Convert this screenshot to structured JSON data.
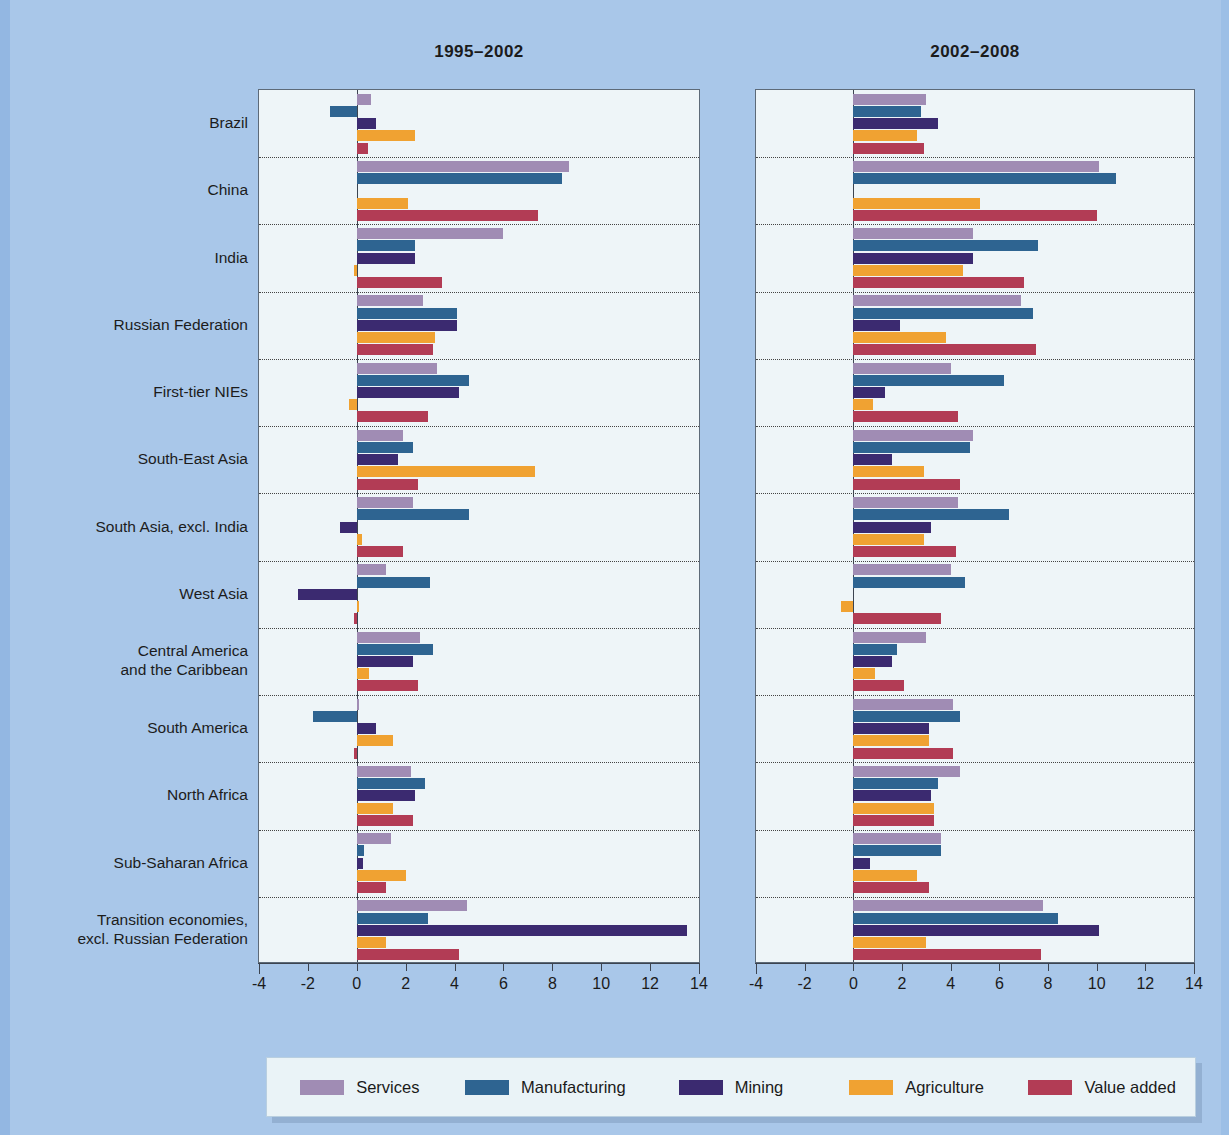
{
  "panels": [
    {
      "title": "1995–2002"
    },
    {
      "title": "2002–2008"
    }
  ],
  "axis": {
    "ticks": [
      "-4",
      "-2",
      "0",
      "2",
      "4",
      "6",
      "8",
      "10",
      "12",
      "14"
    ],
    "min": -4,
    "max": 14
  },
  "legend": [
    {
      "label": "Services",
      "color": "#a08cb4"
    },
    {
      "label": "Manufacturing",
      "color": "#2e6491"
    },
    {
      "label": "Mining",
      "color": "#3b2a70"
    },
    {
      "label": "Agriculture",
      "color": "#f0a232"
    },
    {
      "label": "Value added",
      "color": "#b23c55"
    }
  ],
  "categories": [
    "Brazil",
    "China",
    "India",
    "Russian Federation",
    "First-tier NIEs",
    "South-East Asia",
    "South Asia, excl. India",
    "West Asia",
    "Central America\nand the Caribbean",
    "South America",
    "North Africa",
    "Sub-Saharan Africa",
    "Transition economies,\nexcl. Russian Federation"
  ],
  "chart_data": [
    {
      "type": "bar",
      "title": "1995–2002",
      "orientation": "horizontal",
      "xlabel": "",
      "ylabel": "",
      "xlim": [
        -4,
        14
      ],
      "grid": false,
      "legend_position": "bottom",
      "categories": [
        "Brazil",
        "China",
        "India",
        "Russian Federation",
        "First-tier NIEs",
        "South-East Asia",
        "South Asia, excl. India",
        "West Asia",
        "Central America and the Caribbean",
        "South America",
        "North Africa",
        "Sub-Saharan Africa",
        "Transition economies, excl. Russian Federation"
      ],
      "series": [
        {
          "name": "Services",
          "values": [
            0.6,
            8.7,
            6.0,
            2.7,
            3.3,
            1.9,
            2.3,
            1.2,
            2.6,
            0.1,
            2.2,
            1.4,
            4.5
          ]
        },
        {
          "name": "Manufacturing",
          "values": [
            -1.1,
            8.4,
            2.4,
            4.1,
            4.6,
            2.3,
            4.6,
            3.0,
            3.1,
            -1.8,
            2.8,
            0.3,
            2.9
          ]
        },
        {
          "name": "Mining",
          "values": [
            0.8,
            0.0,
            2.4,
            4.1,
            4.2,
            1.7,
            -0.7,
            -2.4,
            2.3,
            0.8,
            2.4,
            0.25,
            13.5
          ]
        },
        {
          "name": "Agriculture",
          "values": [
            2.4,
            2.1,
            -0.1,
            3.2,
            -0.3,
            7.3,
            0.2,
            0.1,
            0.5,
            1.5,
            1.5,
            2.0,
            1.2
          ]
        },
        {
          "name": "Value added",
          "values": [
            0.45,
            7.4,
            3.5,
            3.1,
            2.9,
            2.5,
            1.9,
            -0.1,
            2.5,
            -0.1,
            2.3,
            1.2,
            4.2
          ]
        }
      ]
    },
    {
      "type": "bar",
      "title": "2002–2008",
      "orientation": "horizontal",
      "xlabel": "",
      "ylabel": "",
      "xlim": [
        -4,
        14
      ],
      "grid": false,
      "legend_position": "bottom",
      "categories": [
        "Brazil",
        "China",
        "India",
        "Russian Federation",
        "First-tier NIEs",
        "South-East Asia",
        "South Asia, excl. India",
        "West Asia",
        "Central America and the Caribbean",
        "South America",
        "North Africa",
        "Sub-Saharan Africa",
        "Transition economies, excl. Russian Federation"
      ],
      "series": [
        {
          "name": "Services",
          "values": [
            3.0,
            10.1,
            4.9,
            6.9,
            4.0,
            4.9,
            4.3,
            4.0,
            3.0,
            4.1,
            4.4,
            3.6,
            7.8
          ]
        },
        {
          "name": "Manufacturing",
          "values": [
            2.8,
            10.8,
            7.6,
            7.4,
            6.2,
            4.8,
            6.4,
            4.6,
            1.8,
            4.4,
            3.5,
            3.6,
            8.4
          ]
        },
        {
          "name": "Mining",
          "values": [
            3.5,
            0.0,
            4.9,
            1.9,
            1.3,
            1.6,
            3.2,
            0.0,
            1.6,
            3.1,
            3.2,
            0.7,
            10.1
          ]
        },
        {
          "name": "Agriculture",
          "values": [
            2.6,
            5.2,
            4.5,
            3.8,
            0.8,
            2.9,
            2.9,
            -0.5,
            0.9,
            3.1,
            3.3,
            2.6,
            3.0
          ]
        },
        {
          "name": "Value added",
          "values": [
            2.9,
            10.0,
            7.0,
            7.5,
            4.3,
            4.4,
            4.2,
            3.6,
            2.1,
            4.1,
            3.3,
            3.1,
            7.7
          ]
        }
      ]
    }
  ]
}
